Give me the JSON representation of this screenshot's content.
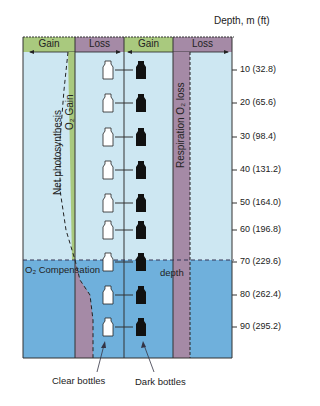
{
  "axis": {
    "title": "Depth, m (ft)",
    "ticks": [
      {
        "label": "10 (32.8)",
        "y": 70
      },
      {
        "label": "20 (65.6)",
        "y": 103
      },
      {
        "label": "30 (98.4)",
        "y": 137
      },
      {
        "label": "40 (131.2)",
        "y": 170
      },
      {
        "label": "50 (164.0)",
        "y": 203
      },
      {
        "label": "60 (196.8)",
        "y": 230
      },
      {
        "label": "70 (229.6)",
        "y": 262
      },
      {
        "label": "80 (262.4)",
        "y": 295
      },
      {
        "label": "90 (295.2)",
        "y": 327
      }
    ]
  },
  "header": {
    "left_gain": "Gain",
    "left_loss": "Loss",
    "right_gain": "Gain",
    "right_loss": "Loss"
  },
  "labels": {
    "net_photosynthesis": "Net photosynthesis",
    "o2_gain": "O₂ Gain",
    "respiration_loss": "Respiration O₂ loss",
    "compensation": "O₂ Compensation",
    "compensation_depth": "depth",
    "clear_bottles": "Clear bottles",
    "dark_bottles": "Dark bottles"
  },
  "colors": {
    "gain_green": "#a9c97e",
    "loss_purple": "#a58aa6",
    "upper_water": "#cde7f2",
    "lower_water": "#6fb0dc",
    "bottle_clear": "#ffffff",
    "bottle_dark": "#111111"
  }
}
